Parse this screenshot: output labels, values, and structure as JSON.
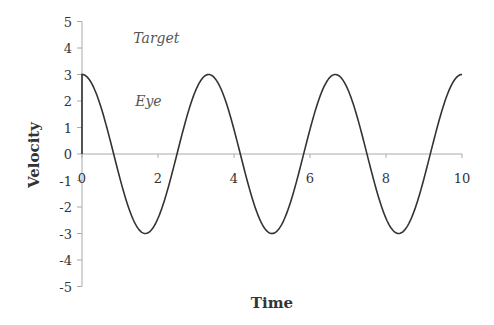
{
  "chart_data": {
    "type": "line",
    "title": "",
    "xlabel": "Time",
    "ylabel": "Velocity",
    "xlim": [
      0,
      10
    ],
    "ylim": [
      -5,
      5
    ],
    "x_ticks": [
      0,
      2,
      4,
      6,
      8,
      10
    ],
    "y_ticks": [
      5,
      4,
      3,
      2,
      1,
      0,
      -1,
      -2,
      -3,
      -4,
      -5
    ],
    "grid": false,
    "legend": null,
    "annotations": [
      {
        "text": "Target",
        "x": 1.35,
        "y": 4.2
      },
      {
        "text": "Eye",
        "x": 1.4,
        "y": 1.8
      }
    ],
    "series": [
      {
        "name": "Eye",
        "description": "Cosine velocity, amplitude 3, period ~3.33; starts at 0 and jumps to 3 at t=0",
        "amplitude": 3,
        "period": 3.333,
        "x": [
          0,
          0,
          0.833,
          1.667,
          2.5,
          3.333,
          4.167,
          5.0,
          5.833,
          6.667,
          7.5,
          8.333,
          9.167,
          10
        ],
        "y": [
          0,
          3,
          0,
          -3,
          0,
          3,
          0,
          -3,
          0,
          3,
          0,
          -3,
          0,
          3
        ]
      }
    ]
  }
}
